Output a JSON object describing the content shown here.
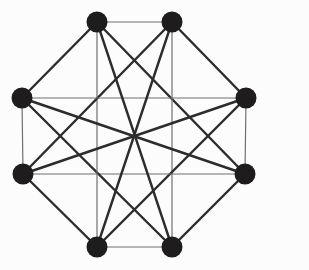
{
  "canvas": {
    "width": 309,
    "height": 270,
    "background": "#fcfcfc"
  },
  "graph": {
    "type": "undirected-graph",
    "node_count": 8,
    "edge_count": 20,
    "node_style": {
      "fill": "#1e1c1c",
      "radius": 10.5
    },
    "edge_styles": {
      "diagonal": {
        "stroke": "#2d2b2b",
        "width": 2.4
      },
      "axis": {
        "stroke": "#6f6f6f",
        "width": 1.2
      }
    },
    "nodes": [
      {
        "id": "n1",
        "label": "top-left",
        "x": 97,
        "y": 22
      },
      {
        "id": "n2",
        "label": "top-right",
        "x": 172,
        "y": 22
      },
      {
        "id": "n3",
        "label": "right-upper",
        "x": 246,
        "y": 98
      },
      {
        "id": "n4",
        "label": "right-lower",
        "x": 245,
        "y": 174
      },
      {
        "id": "n5",
        "label": "bottom-right",
        "x": 172,
        "y": 247
      },
      {
        "id": "n6",
        "label": "bottom-left",
        "x": 97,
        "y": 247
      },
      {
        "id": "n7",
        "label": "left-lower",
        "x": 23,
        "y": 174
      },
      {
        "id": "n8",
        "label": "left-upper",
        "x": 22,
        "y": 98
      }
    ],
    "edges": [
      [
        "n1",
        "n2"
      ],
      [
        "n2",
        "n3"
      ],
      [
        "n3",
        "n4"
      ],
      [
        "n4",
        "n5"
      ],
      [
        "n5",
        "n6"
      ],
      [
        "n6",
        "n7"
      ],
      [
        "n7",
        "n8"
      ],
      [
        "n8",
        "n1"
      ],
      [
        "n1",
        "n4"
      ],
      [
        "n2",
        "n5"
      ],
      [
        "n3",
        "n6"
      ],
      [
        "n4",
        "n7"
      ],
      [
        "n5",
        "n8"
      ],
      [
        "n6",
        "n1"
      ],
      [
        "n7",
        "n2"
      ],
      [
        "n8",
        "n3"
      ],
      [
        "n1",
        "n5"
      ],
      [
        "n2",
        "n6"
      ],
      [
        "n3",
        "n7"
      ],
      [
        "n4",
        "n8"
      ]
    ]
  }
}
